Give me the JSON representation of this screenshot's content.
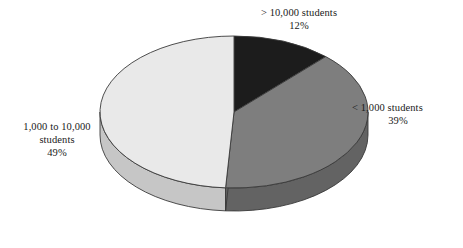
{
  "chart_data": {
    "type": "pie",
    "title": "",
    "subtitle": "",
    "xlabel": "",
    "ylabel": "",
    "grid": false,
    "legend_position": "none",
    "three_d": true,
    "start_angle_deg": 0,
    "direction": "clockwise",
    "background_color": "#ffffff",
    "categories": [
      "> 10,000 students",
      "< 1,000 students",
      "1,000 to 10,000 students"
    ],
    "values": [
      12,
      39,
      49
    ],
    "value_unit": "%",
    "slices": [
      {
        "label": "> 10,000 students",
        "value": 12,
        "value_text": "12%",
        "color": "#1c1c1c",
        "side_color": "#101010",
        "start_deg": 0,
        "end_deg": 43.2
      },
      {
        "label": "< 1,000 students",
        "value": 39,
        "value_text": "39%",
        "color": "#7e7e7e",
        "side_color": "#636363",
        "start_deg": 43.2,
        "end_deg": 183.6
      },
      {
        "label": "1,000 to 10,000 students",
        "value": 49,
        "value_text": "49%",
        "color": "#e9e9e9",
        "side_color": "#c6c6c6",
        "start_deg": 183.6,
        "end_deg": 360
      }
    ]
  },
  "labels": {
    "top": {
      "line1": "> 10,000 students",
      "line2": "12%"
    },
    "right": {
      "line1": "< 1,000 students",
      "line2": "39%"
    },
    "left": {
      "line1": "1,000 to 10,000",
      "line2": "students",
      "line3": "49%"
    }
  }
}
